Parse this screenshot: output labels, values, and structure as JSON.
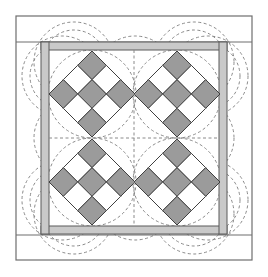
{
  "canvas": {
    "width": 268,
    "height": 277,
    "background": "#ffffff"
  },
  "colors": {
    "dark_patch": "#9b9b9b",
    "light_patch": "#ffffff",
    "sashing": "#c9c9c9",
    "outline": "#3f3f3f",
    "frame_line": "#6e6e6e",
    "quilting_dash": "#8a8a8a"
  },
  "outer_border": {
    "x": 16,
    "y": 16,
    "width": 236,
    "height": 244
  },
  "border_seams": [
    {
      "x1": 16,
      "y1": 42,
      "x2": 252,
      "y2": 42
    },
    {
      "x1": 16,
      "y1": 235,
      "x2": 252,
      "y2": 235
    }
  ],
  "sashing_frame": {
    "outer": {
      "x": 41,
      "y": 42,
      "width": 186,
      "height": 193
    },
    "bar_width": 8
  },
  "inner_area": {
    "x": 49,
    "y": 50,
    "width": 170,
    "height": 176
  },
  "center_guides": {
    "x": 134,
    "y": 138
  },
  "blocks": [
    {
      "name": "top-left",
      "cx": 92,
      "cy": 94,
      "half_diag": 43,
      "pattern": [
        [
          1,
          0,
          1
        ],
        [
          0,
          1,
          0
        ],
        [
          1,
          0,
          1
        ]
      ]
    },
    {
      "name": "top-right",
      "cx": 177,
      "cy": 94,
      "half_diag": 43,
      "pattern": [
        [
          1,
          0,
          1
        ],
        [
          0,
          1,
          0
        ],
        [
          1,
          0,
          1
        ]
      ]
    },
    {
      "name": "bottom-left",
      "cx": 92,
      "cy": 182,
      "half_diag": 43,
      "pattern": [
        [
          1,
          0,
          1
        ],
        [
          0,
          1,
          0
        ],
        [
          1,
          0,
          1
        ]
      ]
    },
    {
      "name": "bottom-right",
      "cx": 177,
      "cy": 182,
      "half_diag": 43,
      "pattern": [
        [
          1,
          0,
          1
        ],
        [
          0,
          1,
          0
        ],
        [
          1,
          0,
          1
        ]
      ]
    }
  ],
  "block_circle_radius": 44,
  "scallops": {
    "top": [
      62,
      135,
      208
    ],
    "side": [
      62,
      138,
      214
    ],
    "outer_radius": 40,
    "inner_radius": 32,
    "top_offset": 22,
    "side_offset": 20
  }
}
